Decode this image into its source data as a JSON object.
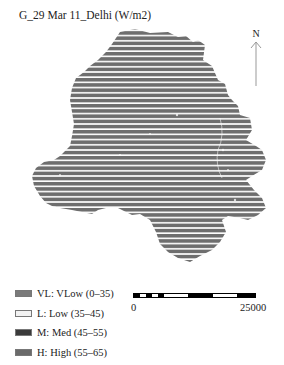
{
  "title": "G_29 Mar 11_Delhi (W/m2)",
  "north_arrow": {
    "label": "N",
    "icon": "north-arrow-icon"
  },
  "map": {
    "region": "Delhi",
    "fill_color": "#6e6e6e",
    "stripe_color": "#ffffff",
    "pattern": "horizontal-stripes"
  },
  "legend": {
    "items": [
      {
        "code": "VL",
        "label": "VL: VLow (0–35)",
        "color": "#7a7a7a"
      },
      {
        "code": "L",
        "label": "L: Low (35–45)",
        "color": "#f2f2f2"
      },
      {
        "code": "M",
        "label": "M: Med (45–55)",
        "color": "#3a3a3a"
      },
      {
        "code": "H",
        "label": "H: High (55–65)",
        "color": "#6a6a6a"
      }
    ]
  },
  "scale_bar": {
    "start_label": "0",
    "end_label": "25000",
    "segments": [
      "#000000",
      "#ffffff",
      "#000000",
      "#ffffff",
      "#000000",
      "#ffffff",
      "#000000",
      "#ffffff",
      "#000000"
    ]
  }
}
